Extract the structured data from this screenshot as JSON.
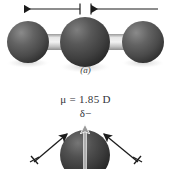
{
  "figure": {
    "background_color": "#ffffff",
    "width": 171,
    "height": 169
  },
  "panel_a": {
    "caption": "(a)",
    "molecule_name": "linear-triatomic-molecule",
    "description": "Linear triatomic space-filling model with two equal and opposite bond dipole arrows",
    "atoms": [
      {
        "label": "left-terminal-atom",
        "cx": 28,
        "cy": 42,
        "r": 21,
        "color": "#4f4f4f"
      },
      {
        "label": "central-atom",
        "cx": 85,
        "cy": 42,
        "r": 25,
        "color": "#434343"
      },
      {
        "label": "right-terminal-atom",
        "cx": 143,
        "cy": 42,
        "r": 21,
        "color": "#4f4f4f"
      }
    ],
    "bonds": [
      {
        "label": "left-bond",
        "x": 44,
        "y": 34,
        "w": 28,
        "h": 16,
        "color": "#b9b9b9"
      },
      {
        "label": "right-bond",
        "x": 100,
        "y": 34,
        "w": 28,
        "h": 16,
        "color": "#b9b9b9"
      }
    ],
    "dipole_arrows": [
      {
        "label": "left-bond-dipole",
        "direction": "left",
        "tail_x": 80,
        "head_x": 22,
        "y": 9,
        "color": "#1c1c1c"
      },
      {
        "label": "right-bond-dipole",
        "direction": "right",
        "tail_x": 91,
        "head_x": 160,
        "y": 9,
        "color": "#1c1c1c"
      }
    ],
    "net_dipole": "0"
  },
  "panel_b": {
    "molecule_name": "water-molecule",
    "description": "Bent molecule with two bond dipoles and a net upward resultant dipole vector",
    "dipole_value_label": "μ = 1.85 D",
    "delta_negative_label": "δ−",
    "atoms": [
      {
        "label": "central-oxygen-atom",
        "cx": 85,
        "cy": 155,
        "r": 25,
        "color": "#3c3c3c"
      }
    ],
    "bond_dipole_arrows": [
      {
        "label": "left-bond-dipole",
        "tail_x": 33,
        "tail_y": 163,
        "head_x": 68,
        "head_y": 133,
        "color": "#1c1c1c"
      },
      {
        "label": "right-bond-dipole",
        "tail_x": 139,
        "tail_y": 163,
        "head_x": 103,
        "head_y": 133,
        "color": "#1c1c1c"
      }
    ],
    "resultant_arrow": {
      "label": "net-dipole-vector",
      "tail_x": 85,
      "tail_y": 169,
      "head_x": 85,
      "head_y": 120,
      "color": "#9a9a9a",
      "outline_color": "#ffffff"
    }
  },
  "colors": {
    "sphere_dark": "#3c3c3c",
    "sphere_mid": "#4f4f4f",
    "bond_gray": "#b9b9b9",
    "arrow_black": "#1c1c1c",
    "text": "#33333a",
    "background": "#ffffff"
  }
}
